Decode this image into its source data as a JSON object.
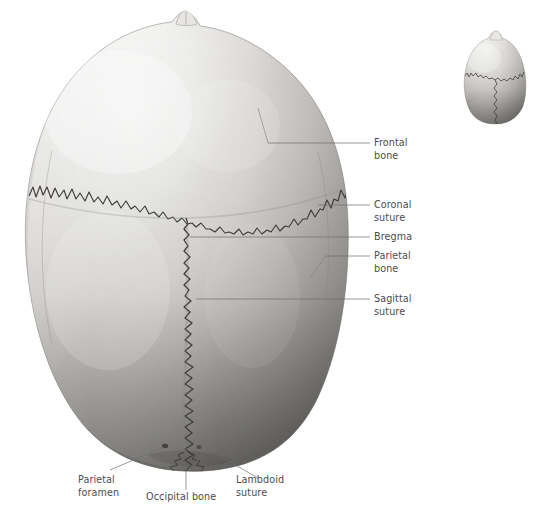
{
  "figure": {
    "background_color": "#ffffff",
    "label_color": "#4c4c4c",
    "leader_color": "#6e6e6e",
    "bone_light": "#f2f2f0",
    "bone_mid": "#c9c9c6",
    "bone_dark": "#6d6d6b",
    "suture_color": "#3a3a38"
  },
  "labels": {
    "frontal_bone_line1": "Frontal",
    "frontal_bone_line2": "bone",
    "coronal_suture_line1": "Coronal",
    "coronal_suture_line2": "suture",
    "bregma": "Bregma",
    "parietal_bone_line1": "Parietal",
    "parietal_bone_line2": "bone",
    "sagittal_suture_line1": "Sagittal",
    "sagittal_suture_line2": "suture",
    "parietal_foramen_line1": "Parietal",
    "parietal_foramen_line2": "foramen",
    "occipital_bone": "Occipital bone",
    "lambdoid_suture_line1": "Lambdoid",
    "lambdoid_suture_line2": "suture"
  },
  "structures": [
    {
      "name": "frontal-bone",
      "label": "Frontal bone"
    },
    {
      "name": "coronal-suture",
      "label": "Coronal suture"
    },
    {
      "name": "bregma",
      "label": "Bregma"
    },
    {
      "name": "parietal-bone",
      "label": "Parietal bone"
    },
    {
      "name": "sagittal-suture",
      "label": "Sagittal suture"
    },
    {
      "name": "parietal-foramen",
      "label": "Parietal foramen"
    },
    {
      "name": "occipital-bone",
      "label": "Occipital bone"
    },
    {
      "name": "lambdoid-suture",
      "label": "Lambdoid suture"
    }
  ],
  "inset": {
    "name": "orientation-inset",
    "description": "Small superior-view skull thumbnail"
  }
}
